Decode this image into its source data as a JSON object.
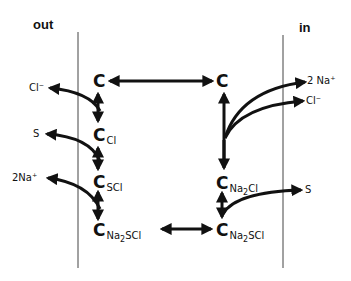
{
  "sides": {
    "out": "out",
    "in": "in"
  },
  "carriers": {
    "top_left": {
      "symbol": "C",
      "sub": ""
    },
    "top_right": {
      "symbol": "C",
      "sub": ""
    },
    "c_cl": {
      "symbol": "C",
      "sub": "Cl"
    },
    "c_scl": {
      "symbol": "C",
      "sub": "SCl"
    },
    "c_na2scl_left": {
      "symbol": "C",
      "sub": "Na2SCl"
    },
    "c_na2cl_right": {
      "symbol": "C",
      "sub": "Na2Cl"
    },
    "c_na2scl_right": {
      "symbol": "C",
      "sub": "Na2SCl"
    }
  },
  "ions_out": {
    "cl": "Cl⁻",
    "s": "S",
    "na": "2Na⁺"
  },
  "ions_in": {
    "na": "2 Na⁺",
    "cl": "Cl⁻",
    "s": "S"
  }
}
